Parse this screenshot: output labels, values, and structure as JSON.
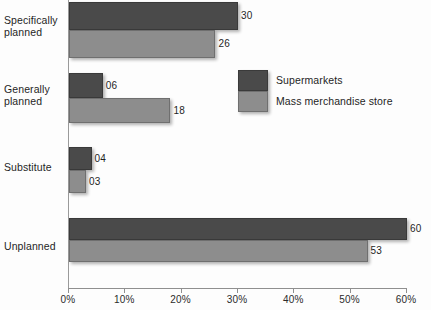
{
  "chart_data": {
    "type": "bar",
    "orientation": "horizontal",
    "title": "",
    "xlabel": "",
    "ylabel": "",
    "xlim": [
      0,
      60
    ],
    "grid": false,
    "legend_position": "center-right",
    "categories": [
      "Specifically planned",
      "Generally planned",
      "Substitute",
      "Unplanned"
    ],
    "tick_labels": [
      "0%",
      "10%",
      "20%",
      "30%",
      "40%",
      "50%",
      "60%"
    ],
    "tick_values": [
      0,
      10,
      20,
      30,
      40,
      50,
      60
    ],
    "series": [
      {
        "name": "Supermarkets",
        "color": "#4a4a4a",
        "values": [
          30,
          6,
          4,
          60
        ],
        "labels": [
          "30",
          "06",
          "04",
          "60"
        ]
      },
      {
        "name": "Mass merchandise store",
        "color": "#8d8d8d",
        "values": [
          26,
          18,
          3,
          53
        ],
        "labels": [
          "26",
          "18",
          "03",
          "53"
        ]
      }
    ]
  },
  "category_lines": [
    [
      "Specifically",
      "planned"
    ],
    [
      "Generally",
      "planned"
    ],
    [
      "Substitute",
      ""
    ],
    [
      "Unplanned",
      ""
    ]
  ]
}
